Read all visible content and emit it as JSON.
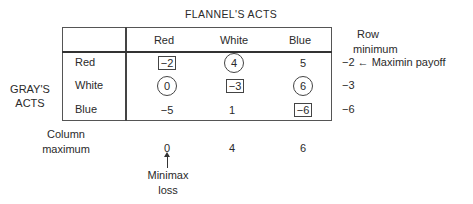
{
  "title": "FLANNEL'S ACTS",
  "row_group_label": [
    "GRAY'S",
    "ACTS"
  ],
  "columns": [
    "Red",
    "White",
    "Blue"
  ],
  "rows": [
    {
      "label": "Red",
      "cells": [
        {
          "value": "−2",
          "mark": "box"
        },
        {
          "value": "4",
          "mark": "circle"
        },
        {
          "value": "5",
          "mark": "none"
        }
      ],
      "row_minimum": "−2"
    },
    {
      "label": "White",
      "cells": [
        {
          "value": "0",
          "mark": "circle"
        },
        {
          "value": "−3",
          "mark": "box"
        },
        {
          "value": "6",
          "mark": "circle"
        }
      ],
      "row_minimum": "−3"
    },
    {
      "label": "Blue",
      "cells": [
        {
          "value": "−5",
          "mark": "none"
        },
        {
          "value": "1",
          "mark": "none"
        },
        {
          "value": "−6",
          "mark": "box"
        }
      ],
      "row_minimum": "−6"
    }
  ],
  "row_minimum_header": [
    "Row",
    "minimum"
  ],
  "maximin_annotation": "← Maximin payoff",
  "column_maximum_label": [
    "Column",
    "maximum"
  ],
  "column_maximums": [
    "0",
    "4",
    "6"
  ],
  "minimax_annotation": [
    "Minimax",
    "loss"
  ]
}
